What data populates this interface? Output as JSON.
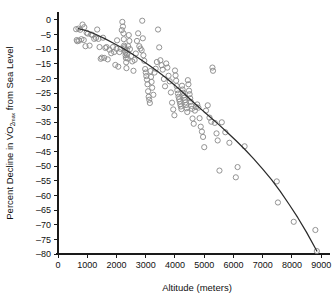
{
  "chart_data": {
    "type": "scatter",
    "title": "",
    "xlabel": "Altitude (meters)",
    "ylabel": "Percent Decline in V̇O2max from Sea Level",
    "ylabel_parts": {
      "prefix": "Percent Decline in V",
      "dot": "̇",
      "O": "O",
      "sub": "2",
      "subsub": "max",
      "suffix": " from Sea Level"
    },
    "xlim": [
      0,
      9300
    ],
    "ylim": [
      -80,
      2
    ],
    "xticks": [
      0,
      1000,
      2000,
      3000,
      4000,
      5000,
      6000,
      7000,
      8000,
      9000
    ],
    "xtick_labels": [
      "0",
      "1000",
      "2000",
      "3000",
      "4000",
      "5000",
      "6000",
      "7000",
      "8000",
      "9000"
    ],
    "yticks": [
      0,
      -5,
      -10,
      -15,
      -20,
      -25,
      -30,
      -35,
      -40,
      -45,
      -50,
      -55,
      -60,
      -65,
      -70,
      -75,
      -80
    ],
    "ytick_labels": [
      "0",
      "–5",
      "–10",
      "–15",
      "–20",
      "–25",
      "–30",
      "–35",
      "–40",
      "–45",
      "–50",
      "–55",
      "–60",
      "–65",
      "–70",
      "–75",
      "–80"
    ],
    "grid": false,
    "legend": null,
    "marker": {
      "shape": "open-circle",
      "color": "#8d8d8d",
      "radius_px": 2.6
    },
    "fit_color": "#2b2b2b",
    "fit_label": "fitted decline curve",
    "fit_points": [
      [
        700,
        -3.0
      ],
      [
        1000,
        -3.8
      ],
      [
        1300,
        -5.0
      ],
      [
        1600,
        -6.4
      ],
      [
        1900,
        -8.0
      ],
      [
        2200,
        -9.6
      ],
      [
        2500,
        -11.4
      ],
      [
        2800,
        -13.4
      ],
      [
        3100,
        -15.4
      ],
      [
        3400,
        -17.6
      ],
      [
        3700,
        -19.9
      ],
      [
        4000,
        -22.4
      ],
      [
        4300,
        -25.1
      ],
      [
        4600,
        -27.9
      ],
      [
        4900,
        -30.6
      ],
      [
        5200,
        -33.2
      ],
      [
        5500,
        -35.8
      ],
      [
        5800,
        -38.6
      ],
      [
        6100,
        -41.4
      ],
      [
        6400,
        -44.4
      ],
      [
        6700,
        -47.6
      ],
      [
        7000,
        -51.0
      ],
      [
        7300,
        -54.6
      ],
      [
        7600,
        -58.6
      ],
      [
        7900,
        -63.0
      ],
      [
        8200,
        -67.6
      ],
      [
        8500,
        -72.6
      ],
      [
        8850,
        -79.0
      ]
    ],
    "points": [
      [
        620,
        -3.2
      ],
      [
        640,
        -6.9
      ],
      [
        660,
        -7.3
      ],
      [
        700,
        -3.0
      ],
      [
        720,
        -7.1
      ],
      [
        760,
        -3.4
      ],
      [
        800,
        -6.6
      ],
      [
        840,
        -1.6
      ],
      [
        880,
        -6.9
      ],
      [
        900,
        -2.5
      ],
      [
        940,
        -9.0
      ],
      [
        980,
        -4.4
      ],
      [
        1020,
        -4.7
      ],
      [
        1080,
        -8.8
      ],
      [
        1140,
        -5.0
      ],
      [
        1180,
        -5.2
      ],
      [
        1240,
        -6.5
      ],
      [
        1300,
        -6.2
      ],
      [
        1340,
        -3.3
      ],
      [
        1380,
        -6.5
      ],
      [
        1420,
        -9.3
      ],
      [
        1460,
        -13.3
      ],
      [
        1500,
        -12.9
      ],
      [
        1540,
        -6.1
      ],
      [
        1580,
        -13.0
      ],
      [
        1620,
        -9.6
      ],
      [
        1660,
        -9.3
      ],
      [
        1700,
        -13.5
      ],
      [
        1760,
        -10.2
      ],
      [
        1820,
        -11.4
      ],
      [
        1880,
        -9.3
      ],
      [
        1920,
        -11.0
      ],
      [
        1960,
        -15.4
      ],
      [
        2000,
        -9.9
      ],
      [
        2020,
        -7.0
      ],
      [
        2060,
        -16.0
      ],
      [
        2100,
        -11.0
      ],
      [
        2140,
        -9.9
      ],
      [
        2180,
        -3.5
      ],
      [
        2200,
        -0.7
      ],
      [
        2220,
        -2.3
      ],
      [
        2240,
        -4.6
      ],
      [
        2250,
        -6.6
      ],
      [
        2260,
        -8.8
      ],
      [
        2270,
        -9.3
      ],
      [
        2280,
        -9.8
      ],
      [
        2290,
        -10.5
      ],
      [
        2300,
        -11.1
      ],
      [
        2310,
        -12.1
      ],
      [
        2320,
        -13.0
      ],
      [
        2330,
        -14.5
      ],
      [
        2340,
        -16.5
      ],
      [
        2350,
        -10.2
      ],
      [
        2360,
        -11.9
      ],
      [
        2380,
        -13.2
      ],
      [
        2400,
        -9.0
      ],
      [
        2420,
        -5.2
      ],
      [
        2440,
        -7.2
      ],
      [
        2460,
        -10.0
      ],
      [
        2500,
        -12.4
      ],
      [
        2540,
        -14.2
      ],
      [
        2580,
        -17.4
      ],
      [
        2620,
        -13.7
      ],
      [
        2660,
        -11.5
      ],
      [
        2700,
        -7.2
      ],
      [
        2740,
        -4.6
      ],
      [
        2780,
        -9.0
      ],
      [
        2820,
        -9.8
      ],
      [
        2860,
        -10.4
      ],
      [
        2880,
        -0.3
      ],
      [
        2900,
        -6.3
      ],
      [
        2920,
        -12.1
      ],
      [
        2950,
        -14.0
      ],
      [
        2980,
        -16.8
      ],
      [
        3000,
        -18.0
      ],
      [
        3020,
        -19.2
      ],
      [
        3040,
        -20.4
      ],
      [
        3060,
        -22.0
      ],
      [
        3080,
        -24.4
      ],
      [
        3100,
        -26.3
      ],
      [
        3120,
        -27.3
      ],
      [
        3140,
        -28.4
      ],
      [
        3160,
        -17.5
      ],
      [
        3180,
        -19.5
      ],
      [
        3200,
        -21.2
      ],
      [
        3220,
        -23.2
      ],
      [
        3260,
        -25.6
      ],
      [
        3300,
        -18.0
      ],
      [
        3340,
        -16.7
      ],
      [
        3380,
        -14.4
      ],
      [
        3420,
        -3.3
      ],
      [
        3460,
        -9.4
      ],
      [
        3500,
        -13.8
      ],
      [
        3540,
        -15.5
      ],
      [
        3580,
        -17.0
      ],
      [
        3620,
        -20.2
      ],
      [
        3660,
        -22.7
      ],
      [
        3700,
        -14.9
      ],
      [
        3740,
        -16.3
      ],
      [
        3780,
        -19.1
      ],
      [
        3820,
        -21.0
      ],
      [
        3860,
        -24.8
      ],
      [
        3900,
        -28.3
      ],
      [
        3940,
        -30.6
      ],
      [
        3980,
        -32.6
      ],
      [
        4000,
        -17.3
      ],
      [
        4020,
        -19.0
      ],
      [
        4040,
        -20.8
      ],
      [
        4060,
        -22.6
      ],
      [
        4080,
        -24.0
      ],
      [
        4100,
        -25.2
      ],
      [
        4120,
        -26.3
      ],
      [
        4140,
        -27.1
      ],
      [
        4160,
        -27.9
      ],
      [
        4180,
        -28.8
      ],
      [
        4200,
        -29.6
      ],
      [
        4220,
        -30.5
      ],
      [
        4240,
        -22.5
      ],
      [
        4260,
        -23.8
      ],
      [
        4280,
        -24.9
      ],
      [
        4300,
        -25.8
      ],
      [
        4320,
        -26.6
      ],
      [
        4340,
        -27.4
      ],
      [
        4360,
        -28.2
      ],
      [
        4380,
        -29.1
      ],
      [
        4400,
        -30.2
      ],
      [
        4420,
        -31.5
      ],
      [
        4440,
        -20.6
      ],
      [
        4460,
        -22.0
      ],
      [
        4480,
        -24.2
      ],
      [
        4500,
        -25.4
      ],
      [
        4520,
        -26.8
      ],
      [
        4540,
        -28.0
      ],
      [
        4560,
        -29.4
      ],
      [
        4580,
        -30.4
      ],
      [
        4600,
        -33.7
      ],
      [
        4640,
        -35.5
      ],
      [
        4680,
        -31.0
      ],
      [
        4720,
        -29.8
      ],
      [
        4760,
        -28.9
      ],
      [
        4800,
        -30.0
      ],
      [
        4840,
        -33.6
      ],
      [
        4880,
        -36.5
      ],
      [
        4920,
        -38.2
      ],
      [
        4960,
        -40.0
      ],
      [
        5000,
        -43.5
      ],
      [
        5060,
        -31.0
      ],
      [
        5120,
        -29.2
      ],
      [
        5180,
        -33.4
      ],
      [
        5240,
        -34.8
      ],
      [
        5280,
        -16.3
      ],
      [
        5300,
        -17.4
      ],
      [
        5360,
        -35.2
      ],
      [
        5420,
        -38.8
      ],
      [
        5460,
        -41.2
      ],
      [
        5520,
        -51.5
      ],
      [
        5600,
        -35.0
      ],
      [
        5720,
        -38.4
      ],
      [
        5860,
        -42.0
      ],
      [
        6080,
        -53.8
      ],
      [
        6140,
        -50.3
      ],
      [
        6380,
        -43.2
      ],
      [
        7480,
        -55.2
      ],
      [
        7520,
        -62.4
      ],
      [
        8060,
        -69.0
      ],
      [
        8800,
        -71.8
      ],
      [
        8850,
        -79.0
      ]
    ]
  }
}
